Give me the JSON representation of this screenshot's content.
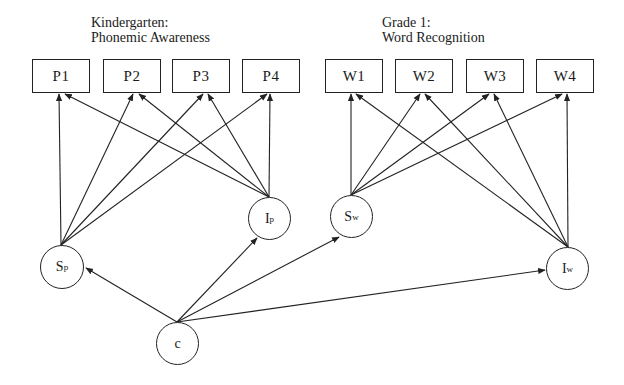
{
  "groups": {
    "kindergarten": {
      "line1": "Kindergarten:",
      "line2": "Phonemic Awareness"
    },
    "grade1": {
      "line1": "Grade 1:",
      "line2": "Word Recognition"
    }
  },
  "indicators": {
    "p1": "P1",
    "p2": "P2",
    "p3": "P3",
    "p4": "P4",
    "w1": "W1",
    "w2": "W2",
    "w3": "W3",
    "w4": "W4"
  },
  "latents": {
    "sp": {
      "base": "S",
      "sub": "p"
    },
    "ip": {
      "base": "I",
      "sub": "p"
    },
    "sw": {
      "base": "S",
      "sub": "w"
    },
    "iw": {
      "base": "I",
      "sub": "w"
    },
    "c": {
      "base": "c",
      "sub": ""
    }
  },
  "edges": [
    {
      "from": "Sp",
      "to": "P1"
    },
    {
      "from": "Sp",
      "to": "P2"
    },
    {
      "from": "Sp",
      "to": "P3"
    },
    {
      "from": "Sp",
      "to": "P4"
    },
    {
      "from": "Ip",
      "to": "P1"
    },
    {
      "from": "Ip",
      "to": "P2"
    },
    {
      "from": "Ip",
      "to": "P3"
    },
    {
      "from": "Ip",
      "to": "P4"
    },
    {
      "from": "Sw",
      "to": "W1"
    },
    {
      "from": "Sw",
      "to": "W2"
    },
    {
      "from": "Sw",
      "to": "W3"
    },
    {
      "from": "Sw",
      "to": "W4"
    },
    {
      "from": "Iw",
      "to": "W1"
    },
    {
      "from": "Iw",
      "to": "W2"
    },
    {
      "from": "Iw",
      "to": "W3"
    },
    {
      "from": "Iw",
      "to": "W4"
    },
    {
      "from": "c",
      "to": "Sp"
    },
    {
      "from": "c",
      "to": "Ip"
    },
    {
      "from": "c",
      "to": "Sw"
    },
    {
      "from": "c",
      "to": "Iw"
    }
  ]
}
